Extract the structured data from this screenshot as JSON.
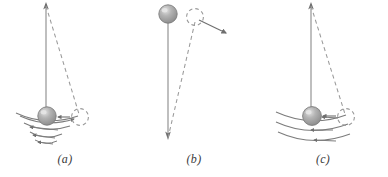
{
  "figure": {
    "background_color": "#ffffff",
    "line_color": "#7a7a7a",
    "dash_color": "#9a9a9a",
    "bob_color": "#9b9b9b",
    "bob_highlight_color": "#d9d9d9",
    "label_color": "#3b3b3b",
    "width": 388,
    "height": 177
  },
  "panels": [
    {
      "id": "a",
      "label": "(a)",
      "description": "damped pendulum with decaying arc arrows",
      "pivot_label": "pivot-arrow-up",
      "bob_label": "pendulum-bob",
      "displaced_label": "displaced-bob-dashed",
      "arc_count": 3,
      "arc_type": "decaying"
    },
    {
      "id": "b",
      "label": "(b)",
      "description": "inverted pendulum with bob at top and escape arrow",
      "pivot_label": "pivot-arrow-down",
      "bob_label": "pendulum-bob",
      "displaced_label": "displaced-bob-dashed",
      "arc_count": 0,
      "arc_type": "none"
    },
    {
      "id": "c",
      "label": "(c)",
      "description": "undamped pendulum with equal width arc arrows",
      "pivot_label": "pivot-arrow-up",
      "bob_label": "pendulum-bob",
      "displaced_label": "displaced-bob-dashed",
      "arc_count": 3,
      "arc_type": "uniform"
    }
  ]
}
